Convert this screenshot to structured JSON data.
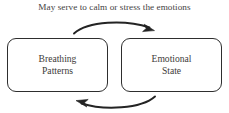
{
  "caption": {
    "text": "May serve to calm or stress the emotions"
  },
  "nodes": [
    {
      "id": "breathing-patterns",
      "line1": "Breathing",
      "line2": "Patterns"
    },
    {
      "id": "emotional-state",
      "line1": "Emotional",
      "line2": "State"
    }
  ],
  "arrows": [
    {
      "id": "arrow-top",
      "direction": "left-to-right",
      "from": "breathing-patterns",
      "to": "emotional-state"
    },
    {
      "id": "arrow-bottom",
      "direction": "right-to-left",
      "from": "emotional-state",
      "to": "breathing-patterns"
    }
  ],
  "colors": {
    "stroke": "#2e2e2e",
    "text": "#3d3b39",
    "caption": "#44423f",
    "background": "#ffffff"
  }
}
